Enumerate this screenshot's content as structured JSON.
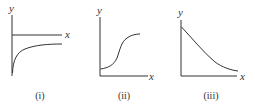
{
  "graphs": [
    {
      "caption": "(i)",
      "x_label": "x",
      "y_label": "y",
      "description": "Curve below x-axis approaching it asymptotically from below (e.g. y = -1/x type)"
    },
    {
      "caption": "(ii)",
      "x_label": "x",
      "y_label": "y",
      "description": "Sigmoid (S-shaped) curve starting above origin and leveling off"
    },
    {
      "caption": "(iii)",
      "x_label": "x",
      "y_label": "y",
      "description": "Decreasing concave-up curve starting on y-axis decaying toward x-axis"
    }
  ],
  "colors": {
    "ink": "#333333",
    "background": "#ffffff"
  }
}
